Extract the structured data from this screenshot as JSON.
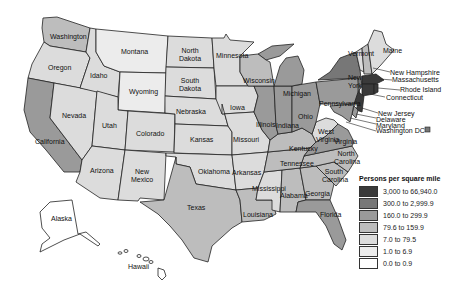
{
  "map": {
    "title": "Persons per square mile",
    "legend": [
      {
        "label": "3,000 to 66,940.0",
        "color": "#3a3a3a"
      },
      {
        "label": "300.0 to 2,999.9",
        "color": "#777777"
      },
      {
        "label": "160.0 to 299.9",
        "color": "#9a9a9a"
      },
      {
        "label": "79.6 to 159.9",
        "color": "#bdbdbd"
      },
      {
        "label": "7.0 to 79.5",
        "color": "#dcdcdc"
      },
      {
        "label": "1.0 to 6.9",
        "color": "#ececec"
      },
      {
        "label": "0.0 to 0.9",
        "color": "#ffffff"
      }
    ],
    "states": {
      "washington": "Washington",
      "oregon": "Oregon",
      "california": "California",
      "nevada": "Nevada",
      "idaho": "Idaho",
      "montana": "Montana",
      "wyoming": "Wyoming",
      "utah": "Utah",
      "arizona": "Arizona",
      "colorado": "Colorado",
      "new_mexico": "New Mexico",
      "north_dakota": "North Dakota",
      "south_dakota": "South Dakota",
      "nebraska": "Nebraska",
      "kansas": "Kansas",
      "oklahoma": "Oklahoma",
      "texas": "Texas",
      "minnesota": "Minnesota",
      "iowa": "Iowa",
      "missouri": "Missouri",
      "arkansas": "Arkansas",
      "louisiana": "Louisiana",
      "wisconsin": "Wisconsin",
      "illinois": "Illinois",
      "michigan": "Michigan",
      "indiana": "Indiana",
      "ohio": "Ohio",
      "kentucky": "Kentucky",
      "tennessee": "Tennessee",
      "mississippi": "Mississippi",
      "alabama": "Alabama",
      "georgia": "Georgia",
      "florida": "Florida",
      "south_carolina": "South Carolina",
      "north_carolina": "North Carolina",
      "virginia": "Virginia",
      "west_virginia": "West Virginia",
      "pennsylvania": "Pennsylvania",
      "new_york": "New York",
      "vermont": "Vermont",
      "maine": "Maine",
      "new_hampshire": "New Hampshire",
      "massachusetts": "Massachusetts",
      "rhode_island": "Rhode Island",
      "connecticut": "Connecticut",
      "new_jersey": "New Jersey",
      "delaware": "Delaware",
      "maryland": "Maryland",
      "washington_dc": "Washington DC",
      "alaska": "Alaska",
      "hawaii": "Hawaii"
    }
  }
}
